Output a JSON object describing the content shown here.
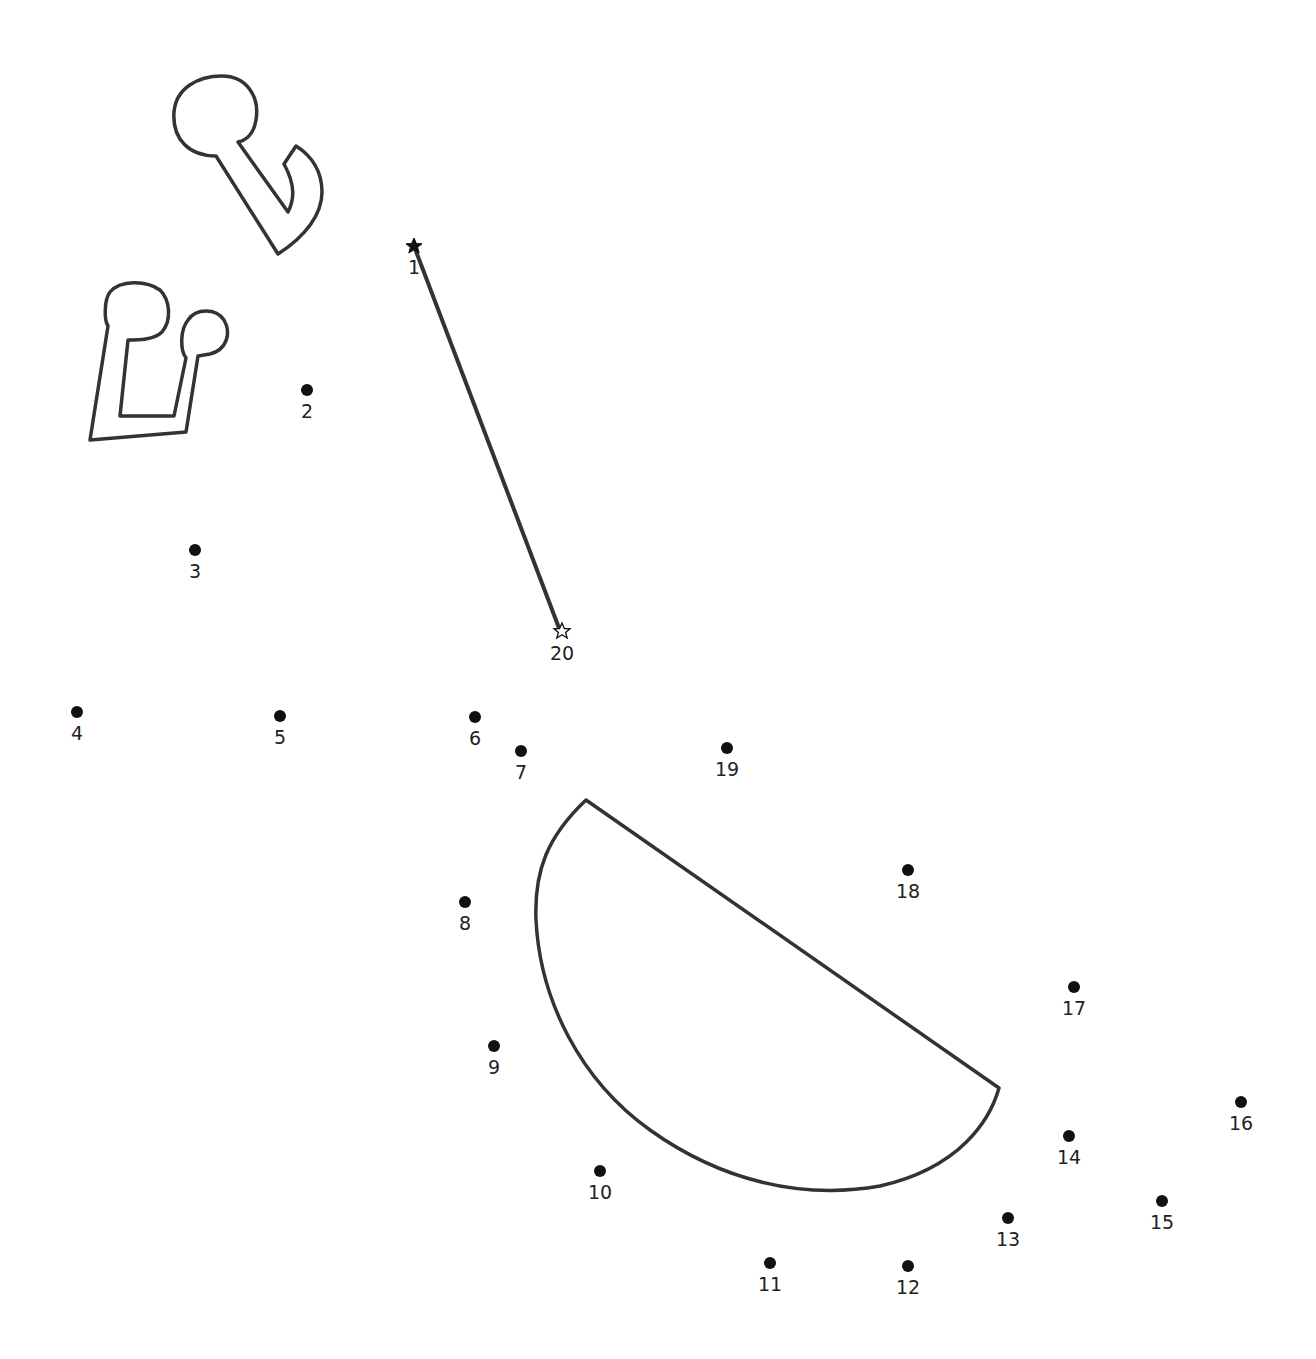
{
  "puzzle": {
    "type": "dot-to-dot",
    "stroke_color": "#333333",
    "start_marker": "filled-star",
    "end_marker": "outline-star",
    "points": [
      {
        "n": "1",
        "x": 414,
        "y": 246,
        "marker": "star-filled"
      },
      {
        "n": "2",
        "x": 307,
        "y": 390
      },
      {
        "n": "3",
        "x": 195,
        "y": 550
      },
      {
        "n": "4",
        "x": 77,
        "y": 712
      },
      {
        "n": "5",
        "x": 280,
        "y": 716
      },
      {
        "n": "6",
        "x": 475,
        "y": 717
      },
      {
        "n": "7",
        "x": 521,
        "y": 751
      },
      {
        "n": "8",
        "x": 465,
        "y": 902
      },
      {
        "n": "9",
        "x": 494,
        "y": 1046
      },
      {
        "n": "10",
        "x": 600,
        "y": 1171
      },
      {
        "n": "11",
        "x": 770,
        "y": 1263
      },
      {
        "n": "12",
        "x": 908,
        "y": 1266
      },
      {
        "n": "13",
        "x": 1008,
        "y": 1218
      },
      {
        "n": "14",
        "x": 1069,
        "y": 1136
      },
      {
        "n": "15",
        "x": 1162,
        "y": 1201
      },
      {
        "n": "16",
        "x": 1241,
        "y": 1102
      },
      {
        "n": "17",
        "x": 1074,
        "y": 987
      },
      {
        "n": "18",
        "x": 908,
        "y": 870
      },
      {
        "n": "19",
        "x": 727,
        "y": 748
      },
      {
        "n": "20",
        "x": 562,
        "y": 632,
        "marker": "star-outline"
      }
    ]
  }
}
